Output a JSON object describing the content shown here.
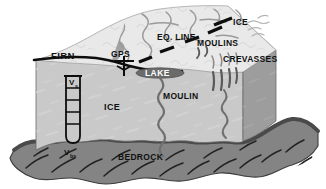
{
  "figure": {
    "labels": {
      "firn": "FIRN",
      "gps": "GPS",
      "eq_line": "EQ. LINE",
      "moulins": "MOULINS",
      "ice_top": "ICE",
      "crevasses": "CREVASSES",
      "lake": "LAKE",
      "ice_body": "ICE",
      "moulin": "MOULIN",
      "bedrock": "BEDROCK",
      "v_surface": "V",
      "v_surface_sub": "s",
      "v_basal": "V",
      "v_basal_sub": "bs"
    },
    "colors": {
      "background": "#ffffff",
      "top_surface": "#e9e9e9",
      "front_face": "#c9c9c9",
      "side_face": "#9d9d9d",
      "bedrock": "#848484",
      "bedrock_dark": "#6e6e6e",
      "stream": "#8e8e8e",
      "lake": "#6b6b6b",
      "outline": "#111111",
      "text": "#111111",
      "text_light": "#ffffff"
    },
    "features": {
      "borehole_segments": 5,
      "crevasse_count": 4,
      "eq_line_dashes": 4,
      "ice_pointer": 1,
      "moulin_channels": 2
    }
  }
}
